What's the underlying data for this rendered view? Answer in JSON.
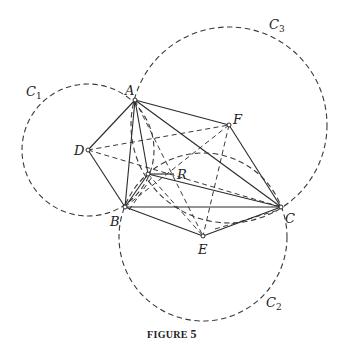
{
  "figure": {
    "caption_prefix": "FIGURE",
    "caption_number": "5",
    "points": {
      "A": {
        "label": "A",
        "x": 135,
        "y": 100
      },
      "B": {
        "label": "B",
        "x": 125,
        "y": 207
      },
      "C": {
        "label": "C",
        "x": 281,
        "y": 207
      },
      "D": {
        "label": "D",
        "x": 88,
        "y": 150
      },
      "E": {
        "label": "E",
        "x": 203,
        "y": 236
      },
      "F": {
        "label": "F",
        "x": 229,
        "y": 125
      },
      "R": {
        "label": "R",
        "x": 148,
        "y": 174
      }
    },
    "circles": [
      {
        "name": "C1",
        "label": "C",
        "subscript": "1",
        "cx": 88,
        "cy": 150,
        "r": 66
      },
      {
        "name": "C2",
        "label": "C",
        "subscript": "2",
        "cx": 203,
        "cy": 237,
        "r": 84
      },
      {
        "name": "C3",
        "label": "C",
        "subscript": "3",
        "cx": 229,
        "cy": 125,
        "r": 98
      }
    ],
    "solid_segments": [
      [
        "A",
        "B"
      ],
      [
        "A",
        "C"
      ],
      [
        "A",
        "F"
      ],
      [
        "F",
        "C"
      ],
      [
        "A",
        "D"
      ],
      [
        "D",
        "B"
      ],
      [
        "B",
        "C"
      ],
      [
        "B",
        "E"
      ],
      [
        "E",
        "C"
      ],
      [
        "A",
        "R"
      ],
      [
        "R",
        "C"
      ],
      [
        "B",
        "R"
      ]
    ],
    "dashed_segments": [
      [
        "D",
        "F"
      ],
      [
        "D",
        "C"
      ],
      [
        "F",
        "E"
      ],
      [
        "A",
        "E"
      ],
      [
        "B",
        "F"
      ],
      [
        "R",
        "E"
      ]
    ]
  }
}
